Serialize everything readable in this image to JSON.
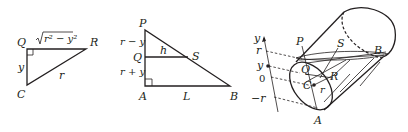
{
  "figure1": {
    "vertices": {
      "Q": "Q",
      "R": "R",
      "C": "C"
    },
    "side_top": "√",
    "side_top_radicand": "r² − y²",
    "side_left": "y",
    "hypotenuse": "r"
  },
  "figure2": {
    "vertices": {
      "P": "P",
      "Q": "Q",
      "A": "A",
      "B": "B",
      "S": "S"
    },
    "seg_upper": "r − y",
    "seg_lower": "r + y",
    "inner": "h",
    "base": "L"
  },
  "figure3": {
    "axis_label": "y",
    "ticks": {
      "r": "r",
      "y": "y",
      "zero": "0",
      "neg_r": "−r"
    },
    "points": {
      "P": "P",
      "S": "S",
      "B": "B",
      "Q": "Q",
      "R": "R",
      "C": "C",
      "r": "r",
      "A": "A"
    }
  }
}
